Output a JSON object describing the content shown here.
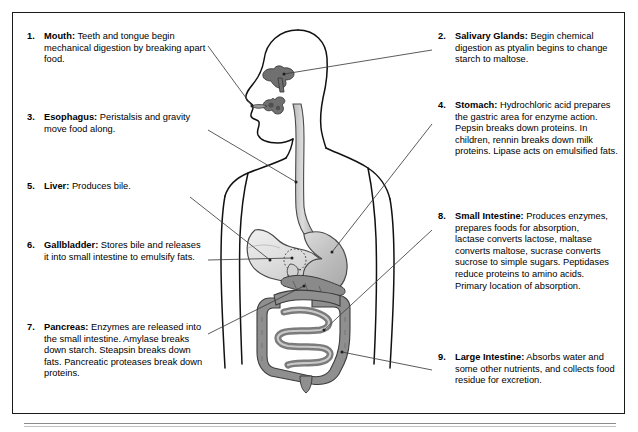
{
  "figure": {
    "colors": {
      "frame_border": "#1a1a1a",
      "background": "#ffffff",
      "body_outline": "#111111",
      "leader_line": "#444444",
      "liver_fill": "#e2e2e2",
      "stomach_fill": "#bdbdbd",
      "esophagus_fill": "#cfcfcf",
      "intestine_fill": "#8f8f8f",
      "pancreas_fill": "#8a8a8a",
      "salivary_fill": "#777777",
      "footer_rule": "#8c8c8c"
    }
  },
  "callouts": [
    {
      "number": "1.",
      "term": "Mouth:",
      "text": " Teeth and tongue begin mechanical digestion by breaking apart food.",
      "side": "left"
    },
    {
      "number": "2.",
      "term": "Salivary Glands:",
      "text": " Begin chemical digestion as ptyalin begins to change starch to maltose.",
      "side": "right"
    },
    {
      "number": "3.",
      "term": "Esophagus:",
      "text": " Peristalsis and gravity move food along.",
      "side": "left"
    },
    {
      "number": "4.",
      "term": "Stomach:",
      "text": " Hydrochloric acid prepares the gastric area for enzyme action. Pepsin breaks down proteins. In children, rennin breaks down milk proteins. Lipase acts on emulsified fats.",
      "side": "right"
    },
    {
      "number": "5.",
      "term": "Liver:",
      "text": " Produces bile.",
      "side": "left"
    },
    {
      "number": "6.",
      "term": "Gallbladder:",
      "text": " Stores bile and releases it into small intestine to emulsify fats.",
      "side": "left"
    },
    {
      "number": "7.",
      "term": "Pancreas:",
      "text": " Enzymes are released into the small intestine. Amylase breaks down starch. Steapsin breaks down fats. Pancreatic proteases break down proteins.",
      "side": "left"
    },
    {
      "number": "8.",
      "term": "Small Intestine:",
      "text": " Produces enzymes, prepares foods for absorption, lactase converts lactose, maltase converts maltose, sucrase converts sucrose to simple sugars. Peptidases reduce proteins to amino acids. Primary location of absorption.",
      "side": "right"
    },
    {
      "number": "9.",
      "term": "Large Intestine:",
      "text": " Absorbs water and some other nutrients, and collects food residue for excretion.",
      "side": "right"
    }
  ]
}
